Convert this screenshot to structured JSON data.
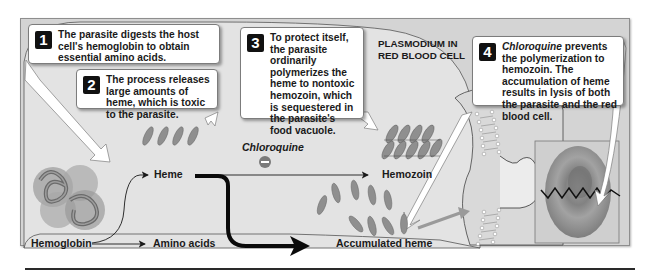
{
  "diagram": {
    "title_region_label": "PLASMODIUM IN RED BLOOD CELL",
    "callouts": [
      {
        "step": "1",
        "text": "The parasite digests the host cell's hemoglobin to obtain essential amino acids."
      },
      {
        "step": "2",
        "text": "The process releases large amounts of heme, which is toxic to the parasite."
      },
      {
        "step": "3",
        "text": "To protect itself, the parasite ordinarily polymerizes the heme to nontoxic hemozoin, which is sequestered in the parasite's food vacuole."
      },
      {
        "step": "4",
        "text_italic": "Chloroquine",
        "text": " prevents the polymerization to hemozoin. The accumulation of heme results in lysis of both the parasite and the red blood cell."
      }
    ],
    "labels": {
      "hemoglobin": "Hemoglobin",
      "amino_acids": "Amino acids",
      "heme": "Heme",
      "hemozoin": "Hemozoin",
      "accumulated_heme": "Accumulated heme",
      "chloroquine": "Chloroquine",
      "inhibition_symbol": "−"
    },
    "pathways": [
      {
        "from": "Hemoglobin",
        "to": "Amino acids"
      },
      {
        "from": "Hemoglobin",
        "to": "Heme"
      },
      {
        "from": "Heme",
        "to": "Hemozoin",
        "inhibited_by": "Chloroquine"
      },
      {
        "from": "Heme",
        "to": "Accumulated heme",
        "emphasis": "bold"
      }
    ],
    "colors": {
      "background_panel": "#d4d4d4",
      "cell_interior": "#e6e6e6",
      "heme_molecule": "#8f8f8f",
      "inhibitor": "#7a7a7a",
      "red_cell": "#8a8a8a",
      "step_badge": "#111111"
    }
  }
}
